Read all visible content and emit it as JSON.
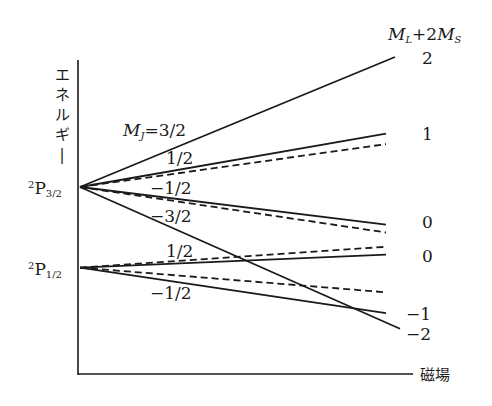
{
  "diagram": {
    "y_axis_label": "エネルギー",
    "x_axis_label": "磁場",
    "right_header": {
      "main1": "M",
      "sub1": "L",
      "plus": "+2",
      "main2": "M",
      "sub2": "S"
    },
    "levels": [
      {
        "id": "p32",
        "sup": "2",
        "main": "P",
        "sub": "3/2"
      },
      {
        "id": "p12",
        "sup": "2",
        "main": "P",
        "sub": "1/2"
      }
    ],
    "mj_prefix_main": "M",
    "mj_prefix_sub": "J",
    "mj_labels": {
      "p32_3_2": "=3/2",
      "p32_1_2": "1/2",
      "p32_m1_2": "−1/2",
      "p32_m3_2": "−3/2",
      "p12_1_2": "1/2",
      "p12_m1_2": "−1/2"
    },
    "right_values": [
      "2",
      "1",
      "0",
      "0",
      "−1",
      "−2"
    ],
    "legend_note": "solid = exact energy, dashed = linear (weak-field) approximation"
  },
  "chart_data": {
    "type": "line",
    "xlabel": "磁場",
    "ylabel": "エネルギー",
    "lines": [
      {
        "name": "2P3/2 MJ=3/2",
        "level": "2P3/2",
        "mj": "3/2",
        "style": "solid",
        "start": 0.0,
        "end": 1.0,
        "ml_2ms": 2
      },
      {
        "name": "2P3/2 MJ=1/2",
        "level": "2P3/2",
        "mj": "1/2",
        "style": "solid",
        "start": 0.0,
        "end": 0.41,
        "ml_2ms": 1
      },
      {
        "name": "2P3/2 MJ=1/2 linear",
        "level": "2P3/2",
        "mj": "1/2",
        "style": "dashed",
        "start": 0.0,
        "end": 0.33
      },
      {
        "name": "2P3/2 MJ=-1/2",
        "level": "2P3/2",
        "mj": "-1/2",
        "style": "solid",
        "start": 0.0,
        "end": -0.29,
        "ml_2ms": 0
      },
      {
        "name": "2P3/2 MJ=-1/2 linear",
        "level": "2P3/2",
        "mj": "-1/2",
        "style": "dashed",
        "start": 0.0,
        "end": -0.35
      },
      {
        "name": "2P3/2 MJ=-3/2",
        "level": "2P3/2",
        "mj": "-3/2",
        "style": "solid",
        "start": 0.0,
        "end": -1.09,
        "ml_2ms": -2
      },
      {
        "name": "2P1/2 MJ=1/2",
        "level": "2P1/2",
        "mj": "1/2",
        "style": "solid",
        "start": -0.62,
        "end": -0.52,
        "ml_2ms": 0
      },
      {
        "name": "2P1/2 MJ=1/2 linear",
        "level": "2P1/2",
        "mj": "1/2",
        "style": "dashed",
        "start": -0.62,
        "end": -0.46
      },
      {
        "name": "2P1/2 MJ=-1/2",
        "level": "2P1/2",
        "mj": "-1/2",
        "style": "solid",
        "start": -0.62,
        "end": -0.97,
        "ml_2ms": -1
      },
      {
        "name": "2P1/2 MJ=-1/2 linear",
        "level": "2P1/2",
        "mj": "-1/2",
        "style": "dashed",
        "start": -0.62,
        "end": -0.81
      }
    ],
    "xlim": [
      0,
      1
    ],
    "ylim": [
      -1.5,
      1.0
    ],
    "grid": false
  }
}
